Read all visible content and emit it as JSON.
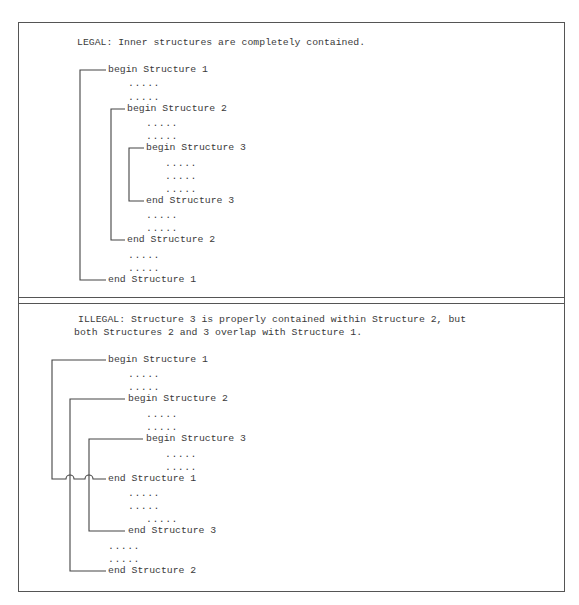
{
  "legal": {
    "heading": "LEGAL: Inner structures are completely contained.",
    "rows": [
      {
        "text": "begin Structure 1",
        "x": 108,
        "y": 70
      },
      {
        "text": ".....",
        "x": 128,
        "y": 84,
        "dots": true
      },
      {
        "text": ".....",
        "x": 128,
        "y": 98,
        "dots": true
      },
      {
        "text": "begin Structure 2",
        "x": 127,
        "y": 109
      },
      {
        "text": ".....",
        "x": 146,
        "y": 124,
        "dots": true
      },
      {
        "text": ".....",
        "x": 146,
        "y": 137,
        "dots": true
      },
      {
        "text": "begin Structure 3",
        "x": 146,
        "y": 148
      },
      {
        "text": ".....",
        "x": 165,
        "y": 164,
        "dots": true
      },
      {
        "text": ".....",
        "x": 165,
        "y": 177,
        "dots": true
      },
      {
        "text": ".....",
        "x": 165,
        "y": 190,
        "dots": true
      },
      {
        "text": "end Structure 3",
        "x": 146,
        "y": 201
      },
      {
        "text": ".....",
        "x": 146,
        "y": 216,
        "dots": true
      },
      {
        "text": ".....",
        "x": 146,
        "y": 229,
        "dots": true
      },
      {
        "text": "end Structure 2",
        "x": 127,
        "y": 240
      },
      {
        "text": ".....",
        "x": 128,
        "y": 256,
        "dots": true
      },
      {
        "text": ".....",
        "x": 128,
        "y": 269,
        "dots": true
      },
      {
        "text": "end Structure 1",
        "x": 108,
        "y": 280
      }
    ]
  },
  "illegal": {
    "heading_line_1": "ILLEGAL: Structure 3 is properly contained within Structure 2, but",
    "heading_line_2": "both Structures 2 and 3 overlap with Structure 1.",
    "rows": [
      {
        "text": "begin Structure 1",
        "x": 108,
        "y": 360
      },
      {
        "text": ".....",
        "x": 128,
        "y": 375,
        "dots": true
      },
      {
        "text": ".....",
        "x": 128,
        "y": 388,
        "dots": true
      },
      {
        "text": "begin Structure 2",
        "x": 128,
        "y": 399
      },
      {
        "text": ".....",
        "x": 146,
        "y": 415,
        "dots": true
      },
      {
        "text": ".....",
        "x": 146,
        "y": 428,
        "dots": true
      },
      {
        "text": "begin Structure 3",
        "x": 146,
        "y": 439
      },
      {
        "text": ".....",
        "x": 165,
        "y": 455,
        "dots": true
      },
      {
        "text": ".....",
        "x": 165,
        "y": 468,
        "dots": true
      },
      {
        "text": "end Structure 1",
        "x": 108,
        "y": 479
      },
      {
        "text": ".....",
        "x": 128,
        "y": 494,
        "dots": true
      },
      {
        "text": ".....",
        "x": 128,
        "y": 507,
        "dots": true
      },
      {
        "text": ".....",
        "x": 146,
        "y": 520,
        "dots": true
      },
      {
        "text": "end Structure 3",
        "x": 128,
        "y": 531
      },
      {
        "text": ".....",
        "x": 108,
        "y": 547,
        "dots": true
      },
      {
        "text": ".....",
        "x": 108,
        "y": 560,
        "dots": true
      },
      {
        "text": "end Structure 2",
        "x": 108,
        "y": 571
      }
    ]
  },
  "colors": {
    "line": "#444444",
    "text": "#3a3a3a",
    "border": "#555555",
    "background": "#ffffff"
  }
}
